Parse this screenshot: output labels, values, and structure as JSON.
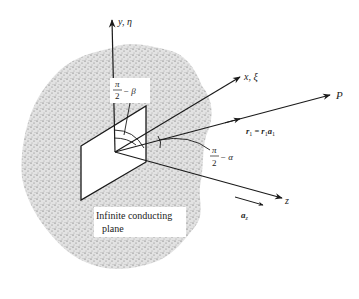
{
  "figure": {
    "axes": {
      "y_label": "y, η",
      "x_label": "x, ξ",
      "z_label": "z"
    },
    "point_label": "P",
    "vector_label": {
      "lhs": "r",
      "lhs_sub": "1",
      "eq": " = ",
      "rhs_mag": "r",
      "rhs_mag_sub": "1",
      "rhs_unit": "a",
      "rhs_unit_sub": "1"
    },
    "unit_vector_label": {
      "base": "a",
      "sub": "z"
    },
    "angle_beta": {
      "num": "π",
      "den": "2",
      "suffix": "− β"
    },
    "angle_alpha": {
      "num": "π",
      "den": "2",
      "suffix": "− α"
    },
    "plane_caption": {
      "line1": "Infinite conducting",
      "line2": "plane"
    },
    "colors": {
      "ink": "#1a1a1a",
      "stipple": "#9a9a9a",
      "background": "#ffffff"
    }
  }
}
